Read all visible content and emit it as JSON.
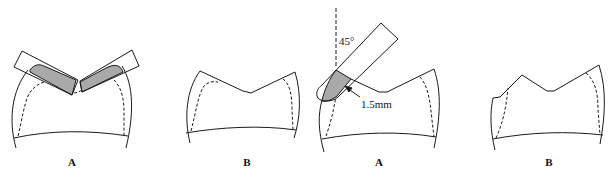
{
  "figures": [
    {
      "id": "fig1",
      "caption": "A",
      "description": "Two rectangular burs cutting V-shaped occlusal reduction with shaded removed tooth structure"
    },
    {
      "id": "fig2",
      "caption": "B",
      "description": "Tooth after occlusal reduction showing V-shaped occlusal outline"
    },
    {
      "id": "fig3",
      "caption": "A",
      "description": "Bur angled 45 degrees to long axis reducing functional cusp bevel",
      "angle_label": "45°",
      "depth_label": "1.5mm"
    },
    {
      "id": "fig4",
      "caption": "B",
      "description": "Tooth after functional cusp bevel"
    }
  ],
  "colors": {
    "line": "#1a1a1a",
    "shade": "#a9a9a9",
    "background": "#ffffff"
  }
}
